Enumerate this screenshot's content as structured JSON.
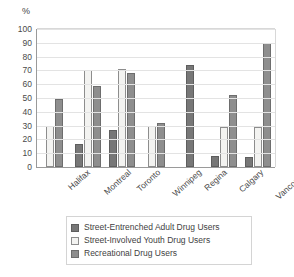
{
  "chart_data": {
    "type": "bar",
    "title": "",
    "subtitle": "",
    "xlabel": "",
    "ylabel": "%",
    "ylim": [
      0,
      100
    ],
    "ytick_step": 10,
    "yticks": [
      100,
      90,
      80,
      70,
      60,
      50,
      40,
      30,
      20,
      10,
      0
    ],
    "grid": true,
    "legend_position": "bottom",
    "categories": [
      "Halifax",
      "Montreal",
      "Toronto",
      "Winnipeg",
      "Regina",
      "Calgary",
      "Vancouver"
    ],
    "series": [
      {
        "name": "Street-Entrenched Adult Drug Users",
        "color": "#777777",
        "values": [
          null,
          17,
          27,
          null,
          74,
          8,
          7
        ]
      },
      {
        "name": "Street-Involved Youth Drug Users",
        "color": "#f3f3f1",
        "values": [
          30,
          70,
          71,
          30,
          null,
          29,
          29
        ]
      },
      {
        "name": "Recreational Drug Users",
        "color": "#8e8e8e",
        "values": [
          49,
          59,
          68,
          32,
          null,
          52,
          90
        ]
      }
    ]
  },
  "axis": {
    "unit_label": "%"
  },
  "legend": {
    "entries": [
      {
        "label": "Street-Entrenched Adult Drug Users",
        "swatch": "#777777",
        "border": "#5e5e5e"
      },
      {
        "label": "Street-Involved Youth Drug Users",
        "swatch": "#f3f3f1",
        "border": "#8d8d8d"
      },
      {
        "label": "Recreational Drug Users",
        "swatch": "#8e8e8e",
        "border": "#6d6d6d"
      }
    ]
  }
}
